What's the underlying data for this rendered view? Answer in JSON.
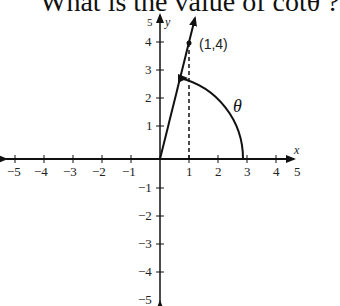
{
  "question": {
    "text": "What is the value of cotθ ?"
  },
  "graph": {
    "x_axis_label": "x",
    "y_axis_label": "y",
    "x_ticks": [
      "−5",
      "−4",
      "−3",
      "−2",
      "−1",
      "1",
      "2",
      "3",
      "4",
      "5"
    ],
    "y_ticks": [
      "5",
      "4",
      "3",
      "2",
      "1",
      "−1",
      "−2",
      "−3",
      "−4",
      "−5"
    ],
    "point_label": "(1,4)",
    "angle_label": "θ",
    "point": {
      "x": 1,
      "y": 4
    }
  }
}
